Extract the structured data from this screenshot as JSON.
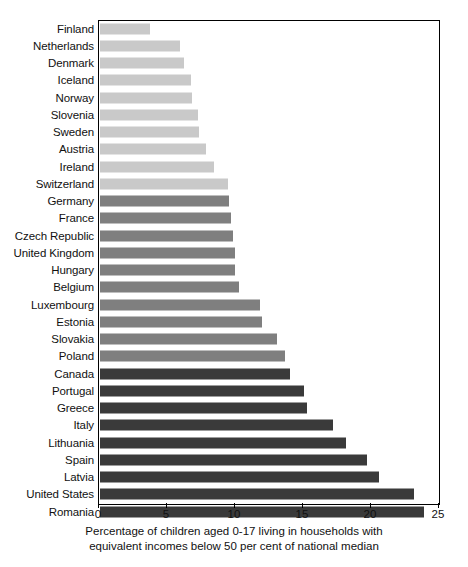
{
  "chart_data": {
    "type": "bar",
    "orientation": "horizontal",
    "title": "",
    "xlabel": "Percentage of children aged  0-17 living in households with equivalent incomes below 50 per cent of national median",
    "ylabel": "",
    "xlim": [
      0,
      25
    ],
    "xticks": [
      0,
      5,
      10,
      15,
      20,
      25
    ],
    "xtick_labels": [
      "0",
      "5",
      "10",
      "15",
      "20",
      "25"
    ],
    "grid": false,
    "legend": "none",
    "categories": [
      "Finland",
      "Netherlands",
      "Denmark",
      "Iceland",
      "Norway",
      "Slovenia",
      "Sweden",
      "Austria",
      "Ireland",
      "Switzerland",
      "Germany",
      "France",
      "Czech Republic",
      "United Kingdom",
      "Hungary",
      "Belgium",
      "Luxembourg",
      "Estonia",
      "Slovakia",
      "Poland",
      "Canada",
      "Portugal",
      "Greece",
      "Italy",
      "Lithuania",
      "Spain",
      "Latvia",
      "United States",
      "Romania"
    ],
    "values": [
      3.7,
      5.9,
      6.2,
      6.7,
      6.8,
      7.2,
      7.3,
      7.8,
      8.4,
      9.4,
      9.5,
      9.6,
      9.8,
      9.9,
      9.9,
      10.2,
      11.8,
      11.9,
      13.0,
      13.6,
      14.0,
      15.0,
      15.2,
      17.1,
      18.1,
      19.6,
      20.5,
      23.1,
      23.8
    ],
    "bar_colors": [
      "#c9c9c9",
      "#c9c9c9",
      "#c9c9c9",
      "#c9c9c9",
      "#c9c9c9",
      "#c9c9c9",
      "#c9c9c9",
      "#c9c9c9",
      "#c9c9c9",
      "#c9c9c9",
      "#7f7f7f",
      "#7f7f7f",
      "#7f7f7f",
      "#7f7f7f",
      "#7f7f7f",
      "#7f7f7f",
      "#7f7f7f",
      "#7f7f7f",
      "#7f7f7f",
      "#7f7f7f",
      "#3a3a3a",
      "#3a3a3a",
      "#3a3a3a",
      "#3a3a3a",
      "#3a3a3a",
      "#3a3a3a",
      "#3a3a3a",
      "#3a3a3a",
      "#3a3a3a"
    ],
    "color_groups": {
      "light": "#c9c9c9",
      "mid": "#7f7f7f",
      "dark": "#3a3a3a"
    }
  },
  "caption": {
    "line1": "Percentage of children aged  0-17 living in households with",
    "line2": "equivalent incomes below 50 per cent of national median"
  }
}
